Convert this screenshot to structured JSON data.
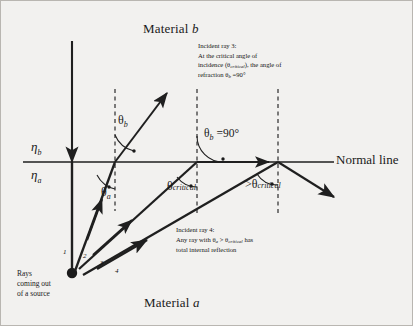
{
  "figure": {
    "title_top": "Material b",
    "title_bottom": "Material a",
    "normal_line_label": "Normal line",
    "media_labels": {
      "upper": "η",
      "upper_sub": "b",
      "lower": "η",
      "lower_sub": "a"
    }
  },
  "angles": {
    "theta_b": "θ",
    "theta_b_sub": "b",
    "theta_a": "θ",
    "theta_a_sub": "a",
    "theta_b_90_symbol": "θ",
    "theta_b_90_sub": "b",
    "theta_b_90_value": " =90°",
    "theta_critical_symbol": "θ",
    "theta_critical_sub": "critical",
    "theta_gt_critical_prefix": ">",
    "theta_gt_critical_symbol": "θ",
    "theta_gt_critical_sub": "critical"
  },
  "annotations": {
    "ray3": {
      "line1": "Incident ray 3:",
      "line2": "At the critical angle of",
      "line3_a": "incidence (θ",
      "line3_sub": "critical",
      "line3_b": "), the angle of",
      "line4_a": "refraction θ",
      "line4_sub": "b",
      "line4_b": " =90°"
    },
    "ray4": {
      "line1": "Incident ray 4:",
      "line2_a": "Any ray with θ",
      "line2_sub_a": "a",
      "line2_b": " > θ",
      "line2_sub_b": "critical",
      "line2_c": " has",
      "line3": "total internal reflection"
    },
    "source": {
      "line1": "Rays",
      "line2": "coming out",
      "line3": "of a source"
    }
  },
  "ray_numbers": [
    "1",
    "2",
    "3",
    "4"
  ],
  "colors": {
    "background": "#f2f1ef",
    "ink": "#1a1a1a",
    "dashed": "#2b2b2b",
    "border": "#b9b6b1"
  }
}
